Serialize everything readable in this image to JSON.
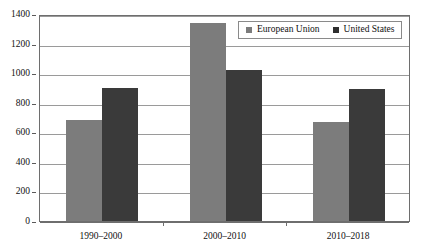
{
  "chart_data": {
    "type": "bar",
    "title": "",
    "subtitle": "",
    "xlabel": "",
    "ylabel": "",
    "categories": [
      "1990–2000",
      "2000–2010",
      "2010–2018"
    ],
    "series": [
      {
        "name": "European Union",
        "color": "#7c7c7c",
        "values": [
          680,
          1340,
          670
        ]
      },
      {
        "name": "United States",
        "color": "#3a3a3a",
        "values": [
          900,
          1020,
          890
        ]
      }
    ],
    "ylim": [
      0,
      1400
    ],
    "yticks": [
      0,
      200,
      400,
      600,
      800,
      1000,
      1200,
      1400
    ],
    "ytick_labels": [
      "0",
      "200",
      "400",
      "600",
      "800",
      "1000",
      "1200",
      "1400"
    ],
    "grid": true,
    "legend_position": "top-right",
    "legend_entries": [
      "European Union",
      "United States"
    ]
  },
  "legend": {
    "entries": [
      {
        "label": "European Union",
        "swatch": "legend-swatch-european-union"
      },
      {
        "label": "United States",
        "swatch": "legend-swatch-united-states"
      }
    ]
  }
}
